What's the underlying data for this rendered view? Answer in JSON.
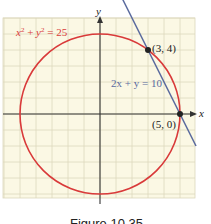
{
  "chart_data": {
    "type": "line",
    "title": "",
    "xlabel": "x",
    "ylabel": "y",
    "xlim": [
      -6,
      6
    ],
    "ylim": [
      -5.5,
      6
    ],
    "grid": true,
    "grid_step": 1,
    "background_color": "#fbf8e4",
    "grid_color": "#ddd8bc",
    "axis_color": "#333333",
    "series": [
      {
        "name": "circle",
        "kind": "circle",
        "equation": "x² + y² = 25",
        "center": [
          0,
          0
        ],
        "radius": 5,
        "color": "#d93a3a"
      },
      {
        "name": "line",
        "kind": "line",
        "equation": "2x + y = 10",
        "slope": -2,
        "intercept": 10,
        "x_range": [
          1.4,
          6
        ],
        "color": "#5a6a9e"
      }
    ],
    "points": [
      {
        "label": "(3, 4)",
        "x": 3,
        "y": 4,
        "color": "#222222"
      },
      {
        "label": "(5, 0)",
        "x": 5,
        "y": 0,
        "color": "#222222"
      }
    ],
    "annotations": [
      {
        "text": "x² + y² = 25",
        "anchor_series": "circle",
        "color": "#d93a3a"
      },
      {
        "text": "2x + y = 10",
        "anchor_series": "line",
        "color": "#5a6a9e"
      }
    ]
  },
  "labels": {
    "circle_eq_x": "x",
    "circle_eq_sup1": "2",
    "circle_eq_mid": " + ",
    "circle_eq_y": "y",
    "circle_eq_sup2": "2",
    "circle_eq_end": " = 25",
    "line_eq": "2x + y = 10",
    "point_a": "(3, 4)",
    "point_b": "(5, 0)",
    "x_axis": "x",
    "y_axis": "y"
  },
  "caption": "Figure 10.35"
}
